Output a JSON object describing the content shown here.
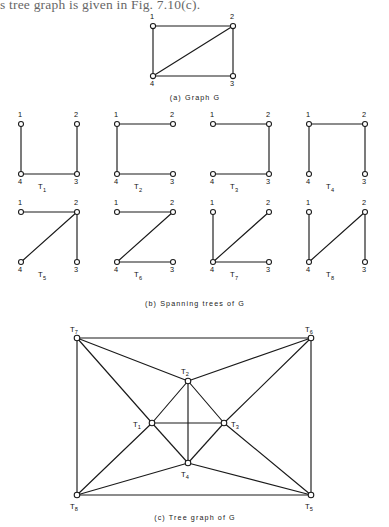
{
  "page": {
    "top_text": "s tree graph is given in Fig. 7.10(c)."
  },
  "figure_a": {
    "caption": "(a)  Graph  G",
    "vertices": [
      {
        "id": "1",
        "label": "1",
        "x": 0,
        "y": 0
      },
      {
        "id": "2",
        "label": "2",
        "x": 1,
        "y": 0
      },
      {
        "id": "3",
        "label": "3",
        "x": 1,
        "y": 1
      },
      {
        "id": "4",
        "label": "4",
        "x": 0,
        "y": 1
      }
    ],
    "edges": [
      [
        "1",
        "2"
      ],
      [
        "2",
        "3"
      ],
      [
        "3",
        "4"
      ],
      [
        "4",
        "1"
      ],
      [
        "4",
        "2"
      ]
    ]
  },
  "figure_b": {
    "caption": "(b)  Spanning trees of  G",
    "vertex_labels": {
      "tl": "1",
      "tr": "2",
      "br": "3",
      "bl": "4"
    },
    "trees": [
      {
        "name": "T",
        "sub": "1",
        "edges": [
          [
            "1",
            "4"
          ],
          [
            "4",
            "3"
          ],
          [
            "3",
            "2"
          ]
        ]
      },
      {
        "name": "T",
        "sub": "2",
        "edges": [
          [
            "1",
            "2"
          ],
          [
            "1",
            "4"
          ],
          [
            "4",
            "3"
          ]
        ]
      },
      {
        "name": "T",
        "sub": "3",
        "edges": [
          [
            "1",
            "2"
          ],
          [
            "2",
            "3"
          ],
          [
            "3",
            "4"
          ]
        ]
      },
      {
        "name": "T",
        "sub": "4",
        "edges": [
          [
            "1",
            "2"
          ],
          [
            "1",
            "4"
          ],
          [
            "2",
            "3"
          ]
        ]
      },
      {
        "name": "T",
        "sub": "5",
        "edges": [
          [
            "1",
            "2"
          ],
          [
            "2",
            "4"
          ],
          [
            "2",
            "3"
          ]
        ]
      },
      {
        "name": "T",
        "sub": "6",
        "edges": [
          [
            "1",
            "2"
          ],
          [
            "2",
            "4"
          ],
          [
            "4",
            "3"
          ]
        ]
      },
      {
        "name": "T",
        "sub": "7",
        "edges": [
          [
            "1",
            "4"
          ],
          [
            "4",
            "2"
          ],
          [
            "4",
            "3"
          ]
        ]
      },
      {
        "name": "T",
        "sub": "8",
        "edges": [
          [
            "1",
            "4"
          ],
          [
            "4",
            "2"
          ],
          [
            "2",
            "3"
          ]
        ]
      }
    ]
  },
  "figure_c": {
    "caption": "(c)  Tree graph of  G",
    "nodes": [
      {
        "id": "T7",
        "name": "T",
        "sub": "7",
        "x": 77,
        "y": 338,
        "lx": 70,
        "ly": 332
      },
      {
        "id": "T6",
        "name": "T",
        "sub": "6",
        "x": 311,
        "y": 338,
        "lx": 305,
        "ly": 332
      },
      {
        "id": "T8",
        "name": "T",
        "sub": "8",
        "x": 77,
        "y": 495,
        "lx": 70,
        "ly": 509
      },
      {
        "id": "T5",
        "name": "T",
        "sub": "5",
        "x": 311,
        "y": 495,
        "lx": 305,
        "ly": 509
      },
      {
        "id": "T2",
        "name": "T",
        "sub": "2",
        "x": 188,
        "y": 381,
        "lx": 181,
        "ly": 374
      },
      {
        "id": "T1",
        "name": "T",
        "sub": "1",
        "x": 152,
        "y": 423,
        "lx": 133,
        "ly": 427
      },
      {
        "id": "T3",
        "name": "T",
        "sub": "3",
        "x": 224,
        "y": 423,
        "lx": 231,
        "ly": 427
      },
      {
        "id": "T4",
        "name": "T",
        "sub": "4",
        "x": 188,
        "y": 463,
        "lx": 181,
        "ly": 477
      }
    ],
    "edges": [
      [
        "T7",
        "T6"
      ],
      [
        "T7",
        "T8"
      ],
      [
        "T6",
        "T5"
      ],
      [
        "T8",
        "T5"
      ],
      [
        "T7",
        "T2"
      ],
      [
        "T7",
        "T1"
      ],
      [
        "T6",
        "T2"
      ],
      [
        "T6",
        "T3"
      ],
      [
        "T8",
        "T1"
      ],
      [
        "T8",
        "T4"
      ],
      [
        "T5",
        "T3"
      ],
      [
        "T5",
        "T4"
      ],
      [
        "T1",
        "T2"
      ],
      [
        "T2",
        "T3"
      ],
      [
        "T3",
        "T4"
      ],
      [
        "T4",
        "T1"
      ],
      [
        "T1",
        "T3"
      ],
      [
        "T2",
        "T4"
      ]
    ]
  },
  "colors": {
    "ink": "#1a1a1a",
    "node_fill": "#ffffff",
    "background": "#ffffff"
  }
}
